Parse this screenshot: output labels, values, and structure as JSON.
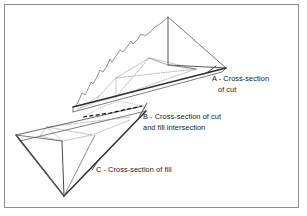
{
  "figure": {
    "background_color": "#ffffff",
    "frame_color": "#8d8d8d",
    "line_color": "#333333",
    "hidden_line_color": "#9a9a9a",
    "terrain_line_color": "#7d7d7d",
    "intersection_line_color": "#111111",
    "labels": [
      {
        "id": "A",
        "line1": "A - Cross-section",
        "line2": "of cut",
        "x": 212,
        "y": 81,
        "line2_x": 218,
        "line2_y": 92
      },
      {
        "id": "B",
        "line1": "B - Cross-section of cut",
        "line2": "and fill intersection",
        "x": 143,
        "y": 119,
        "line2_x": 143,
        "line2_y": 130
      },
      {
        "id": "C",
        "line1": "C - Cross-section of fill",
        "line2": "",
        "x": 96,
        "y": 172,
        "line2_x": 96,
        "line2_y": 172
      }
    ],
    "cut_volume": {
      "name": "cut",
      "description": "Upper right wedge representing material to be cut",
      "apex": [
        168,
        17
      ],
      "right_point": [
        226,
        68
      ],
      "base_front": [
        72,
        107
      ],
      "base_back": [
        150,
        58
      ]
    },
    "fill_volume": {
      "name": "fill",
      "description": "Lower left inverted wedge representing material to be filled",
      "apex": [
        64,
        196
      ],
      "left_point": [
        16,
        135
      ],
      "top_front": [
        140,
        118
      ],
      "top_back": [
        47,
        127
      ]
    },
    "intersection": {
      "name": "cut-fill-intersection",
      "description": "Dashed section line where cut meets fill",
      "from": [
        85,
        116
      ],
      "to": [
        143,
        106
      ]
    }
  }
}
